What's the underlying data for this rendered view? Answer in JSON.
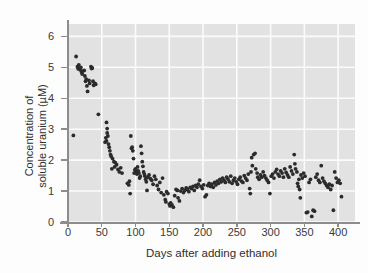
{
  "chart_data": {
    "type": "scatter",
    "title": "",
    "xlabel": "Days after adding ethanol",
    "ylabel": "Concentration of soluble uranium (µM)",
    "ylabel_line1": "Concentration of",
    "ylabel_line2": "soluble uranium (µM)",
    "xlim": [
      0,
      425
    ],
    "ylim": [
      0,
      6.4
    ],
    "xticks": [
      0,
      50,
      100,
      150,
      200,
      250,
      300,
      350,
      400
    ],
    "yticks": [
      0,
      1,
      2,
      3,
      4,
      5,
      6
    ],
    "xtick_labels": [
      "0",
      "50",
      "100",
      "150",
      "200",
      "250",
      "300",
      "350",
      "400"
    ],
    "ytick_labels": [
      "0",
      "1",
      "2",
      "3",
      "4",
      "5",
      "6"
    ],
    "grid": true,
    "legend": "none",
    "marker_color": "#2b2b2b",
    "panel_color": "#e2e2e2",
    "grid_color": "#fbfbfb",
    "series": [
      {
        "name": "soluble uranium",
        "points": [
          [
            8,
            2.8
          ],
          [
            12,
            5.35
          ],
          [
            14,
            5.02
          ],
          [
            15,
            4.95
          ],
          [
            16,
            5.08
          ],
          [
            18,
            4.92
          ],
          [
            19,
            5.0
          ],
          [
            20,
            4.85
          ],
          [
            21,
            4.78
          ],
          [
            22,
            4.88
          ],
          [
            24,
            4.9
          ],
          [
            25,
            4.72
          ],
          [
            26,
            4.55
          ],
          [
            27,
            4.62
          ],
          [
            28,
            4.4
          ],
          [
            29,
            4.22
          ],
          [
            31,
            4.58
          ],
          [
            32,
            4.48
          ],
          [
            34,
            5.02
          ],
          [
            35,
            4.96
          ],
          [
            36,
            4.98
          ],
          [
            37,
            4.55
          ],
          [
            38,
            4.42
          ],
          [
            40,
            4.48
          ],
          [
            41,
            4.45
          ],
          [
            45,
            3.48
          ],
          [
            55,
            2.58
          ],
          [
            56,
            2.72
          ],
          [
            57,
            2.62
          ],
          [
            57,
            3.22
          ],
          [
            58,
            3.02
          ],
          [
            58,
            2.88
          ],
          [
            59,
            2.78
          ],
          [
            60,
            2.52
          ],
          [
            61,
            2.42
          ],
          [
            62,
            2.3
          ],
          [
            63,
            2.18
          ],
          [
            64,
            2.12
          ],
          [
            65,
            1.72
          ],
          [
            66,
            2.05
          ],
          [
            68,
            1.95
          ],
          [
            69,
            1.78
          ],
          [
            70,
            1.92
          ],
          [
            72,
            1.85
          ],
          [
            74,
            1.7
          ],
          [
            76,
            1.62
          ],
          [
            78,
            1.75
          ],
          [
            80,
            1.58
          ],
          [
            88,
            1.25
          ],
          [
            90,
            1.2
          ],
          [
            91,
            1.32
          ],
          [
            92,
            0.92
          ],
          [
            93,
            2.78
          ],
          [
            94,
            2.38
          ],
          [
            95,
            2.42
          ],
          [
            96,
            2.3
          ],
          [
            97,
            2.05
          ],
          [
            98,
            1.58
          ],
          [
            99,
            1.68
          ],
          [
            100,
            1.72
          ],
          [
            101,
            1.62
          ],
          [
            102,
            1.55
          ],
          [
            103,
            1.78
          ],
          [
            104,
            1.65
          ],
          [
            105,
            1.58
          ],
          [
            106,
            1.42
          ],
          [
            107,
            1.48
          ],
          [
            108,
            2.45
          ],
          [
            109,
            2.22
          ],
          [
            110,
            1.95
          ],
          [
            111,
            1.8
          ],
          [
            112,
            1.62
          ],
          [
            113,
            1.55
          ],
          [
            114,
            1.48
          ],
          [
            115,
            1.38
          ],
          [
            116,
            1.3
          ],
          [
            117,
            1.02
          ],
          [
            118,
            1.45
          ],
          [
            120,
            1.52
          ],
          [
            122,
            1.4
          ],
          [
            124,
            1.35
          ],
          [
            126,
            1.22
          ],
          [
            128,
            1.48
          ],
          [
            130,
            1.38
          ],
          [
            132,
            1.18
          ],
          [
            134,
            1.05
          ],
          [
            136,
            1.28
          ],
          [
            138,
            0.95
          ],
          [
            140,
            1.42
          ],
          [
            142,
            0.88
          ],
          [
            144,
            0.72
          ],
          [
            145,
            0.65
          ],
          [
            146,
            0.98
          ],
          [
            148,
            0.92
          ],
          [
            150,
            0.58
          ],
          [
            151,
            0.52
          ],
          [
            152,
            0.62
          ],
          [
            154,
            0.55
          ],
          [
            156,
            0.48
          ],
          [
            158,
            0.85
          ],
          [
            160,
            1.05
          ],
          [
            162,
            1.02
          ],
          [
            163,
            0.78
          ],
          [
            165,
            0.68
          ],
          [
            167,
            1.0
          ],
          [
            169,
            1.08
          ],
          [
            171,
            0.95
          ],
          [
            173,
            1.02
          ],
          [
            175,
            1.1
          ],
          [
            177,
            1.05
          ],
          [
            179,
            0.98
          ],
          [
            181,
            1.12
          ],
          [
            183,
            1.08
          ],
          [
            185,
            1.15
          ],
          [
            187,
            1.02
          ],
          [
            189,
            1.18
          ],
          [
            191,
            1.12
          ],
          [
            193,
            1.22
          ],
          [
            195,
            1.35
          ],
          [
            197,
            1.15
          ],
          [
            199,
            1.08
          ],
          [
            201,
            1.2
          ],
          [
            203,
            0.82
          ],
          [
            205,
            0.88
          ],
          [
            207,
            1.18
          ],
          [
            209,
            1.25
          ],
          [
            211,
            1.15
          ],
          [
            213,
            1.22
          ],
          [
            215,
            1.12
          ],
          [
            217,
            1.28
          ],
          [
            219,
            1.2
          ],
          [
            221,
            1.32
          ],
          [
            223,
            1.25
          ],
          [
            225,
            1.38
          ],
          [
            227,
            1.3
          ],
          [
            229,
            1.42
          ],
          [
            231,
            1.35
          ],
          [
            233,
            1.28
          ],
          [
            235,
            1.45
          ],
          [
            237,
            1.38
          ],
          [
            239,
            1.3
          ],
          [
            241,
            1.48
          ],
          [
            243,
            1.25
          ],
          [
            245,
            1.35
          ],
          [
            247,
            1.42
          ],
          [
            249,
            1.3
          ],
          [
            251,
            1.22
          ],
          [
            253,
            1.38
          ],
          [
            255,
            1.45
          ],
          [
            257,
            1.32
          ],
          [
            259,
            1.28
          ],
          [
            261,
            1.5
          ],
          [
            263,
            1.42
          ],
          [
            265,
            1.35
          ],
          [
            267,
            1.55
          ],
          [
            269,
            1.08
          ],
          [
            270,
            0.92
          ],
          [
            271,
            1.62
          ],
          [
            272,
            2.08
          ],
          [
            273,
            1.82
          ],
          [
            275,
            2.18
          ],
          [
            277,
            2.22
          ],
          [
            278,
            1.72
          ],
          [
            280,
            1.58
          ],
          [
            281,
            1.45
          ],
          [
            283,
            1.38
          ],
          [
            285,
            1.52
          ],
          [
            287,
            1.45
          ],
          [
            289,
            1.62
          ],
          [
            291,
            1.5
          ],
          [
            293,
            1.42
          ],
          [
            295,
            1.35
          ],
          [
            297,
            1.28
          ],
          [
            299,
            0.92
          ],
          [
            301,
            1.48
          ],
          [
            303,
            1.55
          ],
          [
            305,
            1.42
          ],
          [
            307,
            1.62
          ],
          [
            309,
            1.7
          ],
          [
            311,
            1.55
          ],
          [
            313,
            1.48
          ],
          [
            315,
            1.65
          ],
          [
            317,
            1.58
          ],
          [
            319,
            1.45
          ],
          [
            321,
            1.72
          ],
          [
            323,
            1.6
          ],
          [
            325,
            1.52
          ],
          [
            327,
            1.45
          ],
          [
            329,
            1.78
          ],
          [
            331,
            1.65
          ],
          [
            333,
            1.55
          ],
          [
            335,
            2.18
          ],
          [
            336,
            1.88
          ],
          [
            337,
            1.72
          ],
          [
            339,
            1.62
          ],
          [
            340,
            1.25
          ],
          [
            341,
            1.15
          ],
          [
            342,
            1.38
          ],
          [
            343,
            1.05
          ],
          [
            344,
            0.78
          ],
          [
            345,
            1.52
          ],
          [
            347,
            1.42
          ],
          [
            349,
            1.58
          ],
          [
            351,
            1.48
          ],
          [
            353,
            0.3
          ],
          [
            355,
            0.32
          ],
          [
            357,
            1.28
          ],
          [
            359,
            1.38
          ],
          [
            361,
            0.18
          ],
          [
            363,
            0.38
          ],
          [
            365,
            0.35
          ],
          [
            367,
            1.45
          ],
          [
            369,
            1.55
          ],
          [
            371,
            1.35
          ],
          [
            373,
            1.28
          ],
          [
            375,
            1.82
          ],
          [
            377,
            1.42
          ],
          [
            379,
            1.32
          ],
          [
            381,
            1.25
          ],
          [
            383,
            1.18
          ],
          [
            385,
            1.12
          ],
          [
            387,
            1.22
          ],
          [
            389,
            1.05
          ],
          [
            391,
            1.18
          ],
          [
            393,
            0.38
          ],
          [
            395,
            1.62
          ],
          [
            397,
            1.42
          ],
          [
            399,
            1.28
          ],
          [
            401,
            1.35
          ],
          [
            403,
            1.25
          ],
          [
            405,
            0.82
          ]
        ]
      }
    ]
  }
}
